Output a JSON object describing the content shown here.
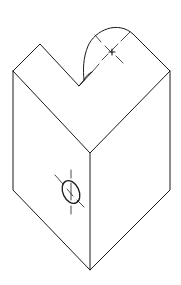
{
  "diagram": {
    "type": "isometric-line-drawing",
    "colors": {
      "line": "#1a1a1a",
      "background": "#ffffff"
    },
    "parts": [
      {
        "name": "block-outline"
      },
      {
        "name": "v-notch"
      },
      {
        "name": "rounded-boss",
        "feature": "center-mark"
      },
      {
        "name": "front-edge"
      },
      {
        "name": "hole",
        "face": "left",
        "feature": "center-mark"
      }
    ]
  }
}
